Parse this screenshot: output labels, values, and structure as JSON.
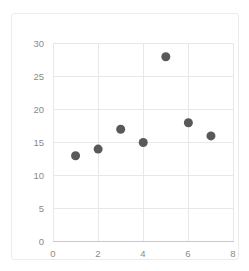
{
  "chart_data": {
    "type": "scatter",
    "title": "",
    "subtitle": "",
    "xlabel": "",
    "ylabel": "",
    "xlim": [
      0,
      8
    ],
    "ylim": [
      0,
      30
    ],
    "grid": true,
    "legend": false,
    "legend_position": "none",
    "marker_color": "#595959",
    "marker_size_px": 9,
    "gridline_color": "#e8e8e9",
    "axis_color": "#c9c9ca",
    "tick_label_color": "#8a8a8a",
    "background_color": "#ffffff",
    "x": [
      1,
      2,
      3,
      4,
      5,
      6,
      7
    ],
    "y": [
      13,
      14,
      17,
      15,
      28,
      18,
      16
    ],
    "points": [
      {
        "x": 1,
        "y": 13
      },
      {
        "x": 2,
        "y": 14
      },
      {
        "x": 3,
        "y": 17
      },
      {
        "x": 4,
        "y": 15
      },
      {
        "x": 5,
        "y": 28
      },
      {
        "x": 6,
        "y": 18
      },
      {
        "x": 7,
        "y": 16
      }
    ],
    "series": [
      {
        "name": "",
        "x": [
          1,
          2,
          3,
          4,
          5,
          6,
          7
        ],
        "values": [
          13,
          14,
          17,
          15,
          28,
          18,
          16
        ]
      }
    ],
    "xticks": [
      0,
      2,
      4,
      6,
      8
    ],
    "xtick_labels": [
      "0",
      "2",
      "4",
      "6",
      "8"
    ],
    "yticks": [
      0,
      5,
      10,
      15,
      20,
      25,
      30
    ],
    "ytick_labels": [
      "0",
      "5",
      "10",
      "15",
      "20",
      "25",
      "30"
    ],
    "annotations": []
  }
}
